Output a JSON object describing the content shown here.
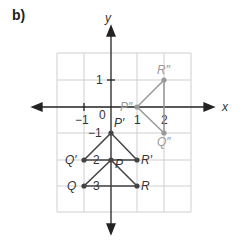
{
  "part_label": "b)",
  "axes": {
    "x_label": "x",
    "y_label": "y"
  },
  "ticks": {
    "x": [
      "−1",
      "0",
      "1",
      "2"
    ],
    "y": [
      "1",
      "−1",
      "2",
      "3"
    ]
  },
  "points": {
    "P": "P",
    "Q": "Q",
    "R": "R",
    "P1": "P′",
    "Q1": "Q′",
    "R1": "R′",
    "P2": "P″",
    "Q2": "Q″",
    "R2": "R″"
  },
  "colors": {
    "dark": "#444444",
    "light": "#999999",
    "grid": "#cccccc"
  }
}
